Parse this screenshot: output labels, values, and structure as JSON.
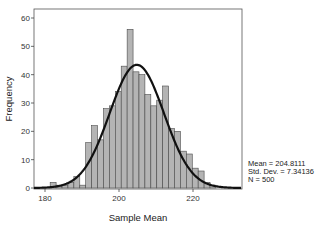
{
  "chart_data": {
    "type": "bar",
    "title": "",
    "xlabel": "Sample Mean",
    "ylabel": "Frequency",
    "xlim": [
      177,
      233
    ],
    "ylim": [
      0,
      63
    ],
    "x_ticks": [
      180,
      200,
      220
    ],
    "y_ticks": [
      0,
      10,
      20,
      30,
      40,
      50,
      60
    ],
    "grid": false,
    "legend": null,
    "bin_width": 1.6,
    "bin_starts": [
      181.4,
      183.0,
      184.6,
      186.2,
      187.8,
      189.4,
      191.0,
      192.6,
      194.2,
      195.8,
      197.4,
      199.0,
      200.6,
      202.2,
      203.8,
      205.4,
      207.0,
      208.6,
      210.2,
      211.8,
      213.4,
      215.0,
      216.6,
      218.2,
      219.8,
      221.4,
      223.0,
      224.6
    ],
    "values": [
      2,
      1,
      1,
      2,
      4,
      1,
      16,
      22,
      17,
      28,
      29,
      34,
      43,
      56,
      41,
      40,
      33,
      29,
      31,
      36,
      21,
      20,
      13,
      12,
      7,
      6,
      2,
      1
    ],
    "overlay": {
      "type": "normal_curve",
      "mean": 204.8111,
      "sd": 7.34136,
      "n": 500
    },
    "annotations": {
      "mean": "Mean = 204.8111",
      "sd": "Std. Dev. = 7.34136",
      "n": "N = 500"
    }
  }
}
